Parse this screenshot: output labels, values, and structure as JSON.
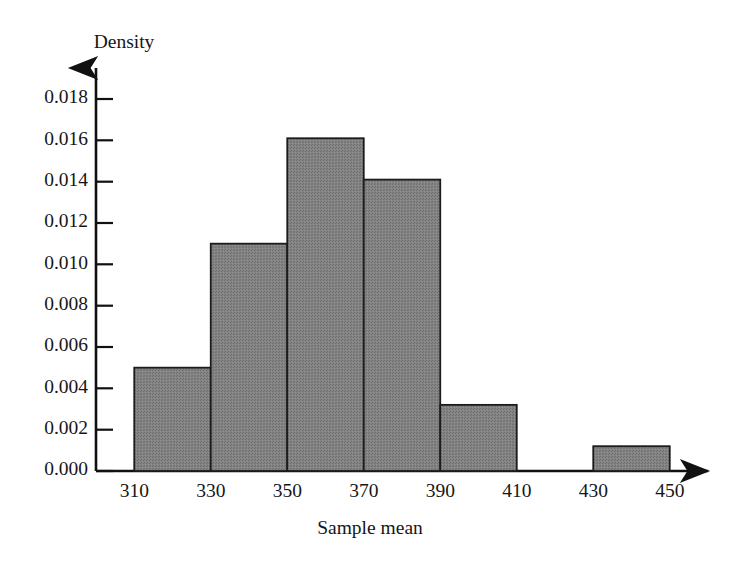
{
  "chart_data": {
    "type": "bar",
    "title": "",
    "subtitle": "",
    "xlabel": "Sample mean",
    "ylabel": "Density",
    "grid": false,
    "legend": false,
    "legend_position": "none",
    "bar_style": "histogram",
    "bar_fill_color": "#808080",
    "bar_edge_color": "#1c1c1c",
    "axis_color": "#111111",
    "background_color": "#ffffff",
    "xlim": [
      300,
      460
    ],
    "ylim": [
      0.0,
      0.019
    ],
    "xticks": [
      310,
      330,
      350,
      370,
      390,
      410,
      430,
      450
    ],
    "xtick_labels": [
      "310",
      "330",
      "350",
      "370",
      "390",
      "410",
      "430",
      "450"
    ],
    "yticks": [
      0.0,
      0.002,
      0.004,
      0.006,
      0.008,
      0.01,
      0.012,
      0.014,
      0.016,
      0.018
    ],
    "ytick_labels": [
      "0.000",
      "0.002",
      "0.004",
      "0.006",
      "0.008",
      "0.010",
      "0.012",
      "0.014",
      "0.016",
      "0.018"
    ],
    "bin_width": 20,
    "bins": [
      {
        "label": "310-330",
        "left": 310,
        "right": 330,
        "density": 0.005
      },
      {
        "label": "330-350",
        "left": 330,
        "right": 350,
        "density": 0.011
      },
      {
        "label": "350-370",
        "left": 350,
        "right": 370,
        "density": 0.0161
      },
      {
        "label": "370-390",
        "left": 370,
        "right": 390,
        "density": 0.0141
      },
      {
        "label": "390-410",
        "left": 390,
        "right": 410,
        "density": 0.0032
      },
      {
        "label": "410-430",
        "left": 410,
        "right": 430,
        "density": 0.0
      },
      {
        "label": "430-450",
        "left": 430,
        "right": 450,
        "density": 0.0012
      }
    ],
    "categories": [
      "310-330",
      "330-350",
      "350-370",
      "370-390",
      "390-410",
      "410-430",
      "430-450"
    ],
    "values": [
      0.005,
      0.011,
      0.0161,
      0.0141,
      0.0032,
      0.0,
      0.0012
    ],
    "annotations": []
  }
}
